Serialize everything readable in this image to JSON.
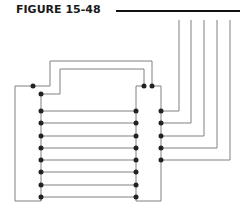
{
  "figure": {
    "title": "FIGURE 15-48"
  },
  "colors": {
    "wire": "#808080",
    "rule": "#111111",
    "node": "#222222"
  },
  "diagram": {
    "rungs_count": 8,
    "right_leads_count": 5
  }
}
